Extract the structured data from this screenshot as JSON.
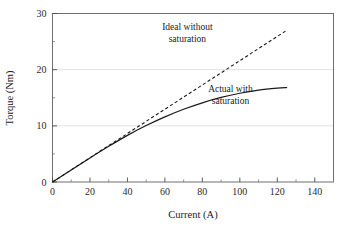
{
  "chart_data": {
    "type": "line",
    "title": "",
    "xlabel": "Current (A)",
    "ylabel": "Torque (Nm)",
    "xlim": [
      0,
      150
    ],
    "ylim": [
      0,
      30
    ],
    "xticks": [
      0,
      20,
      40,
      60,
      80,
      100,
      120,
      140
    ],
    "yticks": [
      0,
      10,
      20,
      30
    ],
    "xticklabels": [
      "0",
      "20",
      "40",
      "60",
      "80",
      "100",
      "120",
      "140"
    ],
    "yticklabels": [
      "0",
      "10",
      "20",
      "30"
    ],
    "x_minor_ticks": [
      10,
      30,
      50,
      70,
      90,
      110,
      130,
      150
    ],
    "y_minor_ticks": [
      5,
      15,
      25
    ],
    "grid": "horizontal-major-only",
    "gridlines_y": [
      10,
      20
    ],
    "legend": "none",
    "series": [
      {
        "name": "Ideal without saturation",
        "style": "dashed",
        "color": "#1a1a1a",
        "x": [
          0,
          10,
          20,
          30,
          40,
          50,
          60,
          70,
          80,
          90,
          100,
          110,
          120,
          125
        ],
        "y": [
          0,
          2.16,
          4.32,
          6.48,
          8.64,
          10.8,
          12.96,
          15.12,
          17.28,
          19.44,
          21.6,
          23.76,
          25.92,
          27.0
        ]
      },
      {
        "name": "Actual with saturation",
        "style": "solid",
        "color": "#1a1a1a",
        "x": [
          0,
          10,
          20,
          30,
          40,
          50,
          60,
          70,
          80,
          90,
          100,
          110,
          120,
          125
        ],
        "y": [
          0,
          2.15,
          4.28,
          6.35,
          8.3,
          10.05,
          11.6,
          12.95,
          14.1,
          15.05,
          15.8,
          16.35,
          16.7,
          16.8
        ]
      }
    ],
    "annotations": [
      {
        "name": "ideal-annotation",
        "lines": [
          "Ideal without",
          "saturation"
        ],
        "x": 72,
        "y": 27.0
      },
      {
        "name": "actual-annotation",
        "lines": [
          "Actual with",
          "saturation"
        ],
        "x": 95,
        "y": 16.0
      }
    ],
    "colors": {
      "background": "#ffffff",
      "frame": "#6e6e6e",
      "gridline": "#e2e2e2",
      "curve": "#1a1a1a",
      "text": "#1a1a1a"
    }
  }
}
